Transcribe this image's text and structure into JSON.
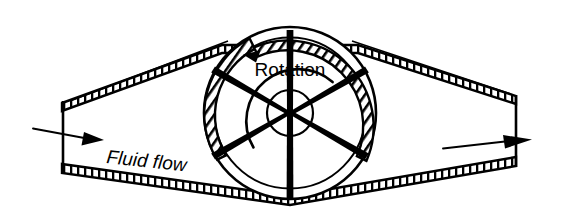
{
  "figure": {
    "background_color": "#ffffff",
    "ink_color": "#000000"
  },
  "labels": {
    "rotation": {
      "text": "Rotation",
      "x": 290,
      "y": 76,
      "font_size": 19,
      "style": "normal",
      "anchor": "middle"
    },
    "fluid_flow": {
      "text": "Fluid flow",
      "x": 106,
      "y": 163,
      "font_size": 19,
      "style": "italic",
      "rotate_deg": 6,
      "anchor": "start"
    }
  },
  "arrows": {
    "inlet_flow": {
      "name": "inlet-flow-arrow",
      "x1": 32,
      "y1": 128,
      "x2": 101,
      "y2": 141,
      "head_length": 19,
      "head_width": 11
    },
    "outlet_flow": {
      "name": "outlet-flow-arrow",
      "x1": 443,
      "y1": 148,
      "x2": 530,
      "y2": 139,
      "head_length": 21,
      "head_width": 11
    },
    "rotation_arc": {
      "name": "rotation-arc-arrow",
      "direction": "counter-clockwise",
      "radius": 52,
      "start_angle_deg": 18,
      "end_angle_deg": 160,
      "head_at": "start_of_sweep_left"
    }
  },
  "wheel": {
    "name": "paddle-wheel",
    "center_x": 290,
    "center_y": 113,
    "outer_radius": 86,
    "rim_inner_radius": 75,
    "hub_radius": 23,
    "spoke_count": 6,
    "spoke_angles_deg": [
      90,
      150,
      210,
      270,
      330,
      30
    ],
    "rim_band_arcs": [
      {
        "name": "rim-band-left",
        "start_deg": 118,
        "end_deg": 212
      },
      {
        "name": "rim-band-right",
        "start_deg": 318,
        "end_deg": 62
      }
    ],
    "rim_hatch_count": 46
  },
  "pipe": {
    "name": "pipe-housing",
    "wall_thickness": 8,
    "hatch_pitch": 7,
    "left_opening": {
      "top_y": 103,
      "bottom_y": 164,
      "x": 62
    },
    "right_opening": {
      "top_y": 96,
      "bottom_y": 157,
      "x": 516
    },
    "top_wall_points": "62,103 222,45 358,45 516,96",
    "bottom_wall_points": "62,164 290,196 516,157",
    "inner_top_guide": "70,100 226,40",
    "inner_top_guide_right": "356,40 512,95"
  }
}
